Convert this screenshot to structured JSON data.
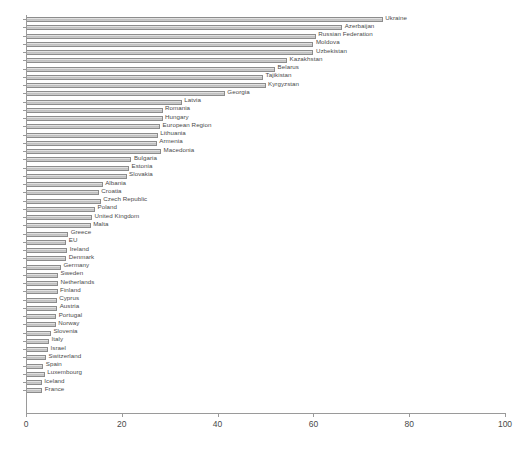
{
  "chart_data": {
    "type": "bar",
    "orientation": "horizontal",
    "title": "",
    "subtitle": "",
    "xlabel": "",
    "ylabel": "",
    "xlim": [
      0,
      100
    ],
    "ylim": null,
    "grid": false,
    "legend": null,
    "xticks": [
      0,
      20,
      40,
      60,
      80,
      100
    ],
    "xtick_labels": [
      "0",
      "20",
      "40",
      "60",
      "80",
      "100"
    ],
    "categories": [
      "Ukraine",
      "Azerbaijan",
      "Russian Federation",
      "Moldova",
      "Uzbekistan",
      "Kazakhstan",
      "Belarus",
      "Tajikistan",
      "Kyrgyzstan",
      "Georgia",
      "Latvia",
      "Romania",
      "Hungary",
      "European Region",
      "Lithuania",
      "Armenia",
      "Macedonia",
      "Bulgaria",
      "Estonia",
      "Slovakia",
      "Albania",
      "Croatia",
      "Czech Republic",
      "Poland",
      "United Kingdom",
      "Malta",
      "Greece",
      "EU",
      "Ireland",
      "Denmark",
      "Germany",
      "Sweden",
      "Netherlands",
      "Finland",
      "Cyprus",
      "Austria",
      "Portugal",
      "Norway",
      "Slovenia",
      "Italy",
      "Israel",
      "Switzerland",
      "Spain",
      "Luxembourg",
      "Iceland",
      "France"
    ],
    "values": [
      74.5,
      66.0,
      60.5,
      60.0,
      60.0,
      54.5,
      52.0,
      49.5,
      50.0,
      41.5,
      32.5,
      28.5,
      28.5,
      28.0,
      27.5,
      27.3,
      28.2,
      22.0,
      21.5,
      21.0,
      16.0,
      15.2,
      15.6,
      14.4,
      13.8,
      13.5,
      8.8,
      8.4,
      8.6,
      8.4,
      7.3,
      6.7,
      6.7,
      6.6,
      6.4,
      6.5,
      6.3,
      6.2,
      5.2,
      4.8,
      4.6,
      4.2,
      3.6,
      3.9,
      3.3,
      3.4
    ],
    "bar_color": "#c6c6c6",
    "bar_edge_color": "#8c8c8c",
    "axis_color": "#9a9a9a",
    "text_color": "#4a4a4a",
    "background": "#ffffff"
  }
}
